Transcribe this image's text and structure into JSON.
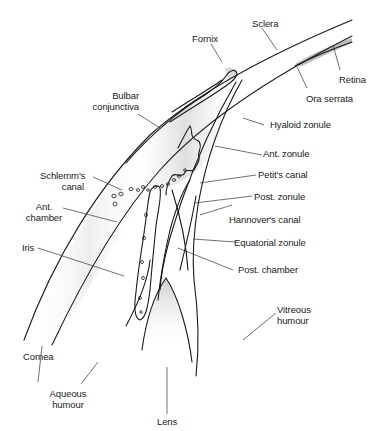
{
  "diagram": {
    "title": "",
    "colors": {
      "line": "#1a1a1a",
      "leader": "#333333",
      "shade": "#cfcfcf",
      "text": "#222222"
    },
    "labels": {
      "sclera": "Sclera",
      "fornix": "Fornix",
      "retina": "Retina",
      "ora_serrata": "Ora serrata",
      "bulbar_conjunctiva_1": "Bulbar",
      "bulbar_conjunctiva_2": "conjunctiva",
      "hyaloid_zonule": "Hyaloid zonule",
      "ant_zonule": "Ant. zonule",
      "schlemms_canal_1": "Schlemm's",
      "schlemms_canal_2": "canal",
      "petits_canal": "Petit's canal",
      "ant_chamber_1": "Ant.",
      "ant_chamber_2": "chamber",
      "post_zonule": "Post. zonule",
      "hannovers_canal": "Hannover's canal",
      "iris": "Iris",
      "equatorial_zonule": "Equatorial zonule",
      "post_chamber": "Post. chamber",
      "vitreous_humour_1": "Vitreous",
      "vitreous_humour_2": "humour",
      "cornea": "Cornea",
      "aqueous_humour_1": "Aqueous",
      "aqueous_humour_2": "humour",
      "lens": "Lens"
    }
  }
}
